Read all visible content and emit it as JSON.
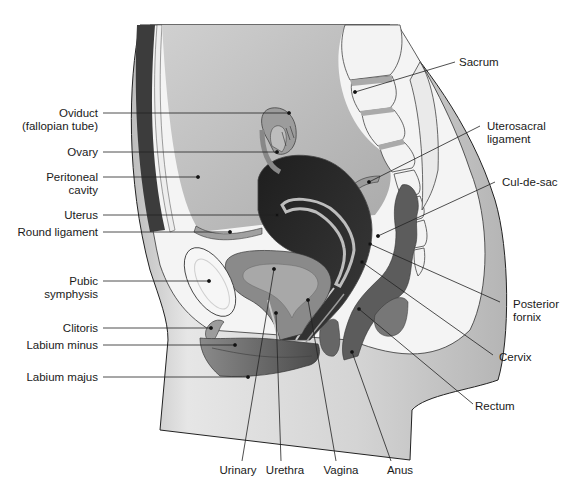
{
  "figure": {
    "type": "sagittal section"
  },
  "colors": {
    "background": "#ffffff",
    "skin": "#c9c9c9",
    "skin_light": "#e2e2e2",
    "cavity": "#b8b8b8",
    "bone": "#f1f1f1",
    "uterus": "#2b2b2b",
    "bladder": "#8c8c8c",
    "rectum": "#5a5a5a",
    "lines": "#222222"
  },
  "labels": {
    "left": [
      {
        "id": "oviduct",
        "line1": "Oviduct",
        "line2": "(fallopian tube)"
      },
      {
        "id": "ovary",
        "line1": "Ovary"
      },
      {
        "id": "peritoneal-cavity",
        "line1": "Peritoneal",
        "line2": "cavity"
      },
      {
        "id": "uterus",
        "line1": "Uterus"
      },
      {
        "id": "round-ligament",
        "line1": "Round ligament"
      },
      {
        "id": "pubic-symphysis",
        "line1": "Pubic",
        "line2": "symphysis"
      },
      {
        "id": "clitoris",
        "line1": "Clitoris"
      },
      {
        "id": "labium-minus",
        "line1": "Labium minus"
      },
      {
        "id": "labium-majus",
        "line1": "Labium majus"
      }
    ],
    "right": [
      {
        "id": "sacrum",
        "line1": "Sacrum"
      },
      {
        "id": "uterosacral-ligament",
        "line1": "Uterosacral",
        "line2": "ligament"
      },
      {
        "id": "cul-de-sac",
        "line1": "Cul-de-sac"
      },
      {
        "id": "posterior-fornix",
        "line1": "Posterior",
        "line2": "fornix"
      },
      {
        "id": "cervix",
        "line1": "Cervix"
      },
      {
        "id": "rectum",
        "line1": "Rectum"
      }
    ],
    "bottom": [
      {
        "id": "urinary",
        "line1": "Urinary"
      },
      {
        "id": "urethra",
        "line1": "Urethra"
      },
      {
        "id": "vagina",
        "line1": "Vagina"
      },
      {
        "id": "anus",
        "line1": "Anus"
      }
    ]
  }
}
